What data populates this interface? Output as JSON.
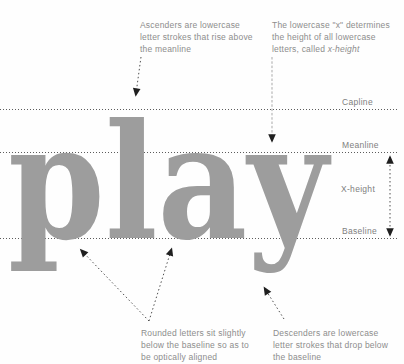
{
  "canvas": {
    "width": 404,
    "height": 364
  },
  "colors": {
    "background": "#fefefe",
    "word": "#9d9d9d",
    "guide_line": "#5c5c5c",
    "label_text": "#7e7e7e",
    "annotation_text": "#8d8d8d",
    "arrow_line": "#4f4f4f",
    "arrow_line_light": "#a9a9a9",
    "arrow_head": "#1f1f1f"
  },
  "word": {
    "text": "play"
  },
  "guide_labels": {
    "capline": "Capline",
    "meanline": "Meanline",
    "xheight": "X-height",
    "baseline": "Baseline"
  },
  "annotations": {
    "ascenders": {
      "text": "Ascenders are lowercase\nletter strokes that rise above\nthe meanline"
    },
    "xheight_def": {
      "line1": "The lowercase \"x\" determines",
      "line2": "the height of all lowercase",
      "line3_prefix": "letters, called ",
      "line3_italic": "x-height"
    },
    "rounded": {
      "text": "Rounded letters sit slightly\nbelow the baseline so as to\nbe optically aligned"
    },
    "descenders": {
      "text": "Descenders are lowercase\nletter strokes that drop below\nthe baseline"
    }
  }
}
